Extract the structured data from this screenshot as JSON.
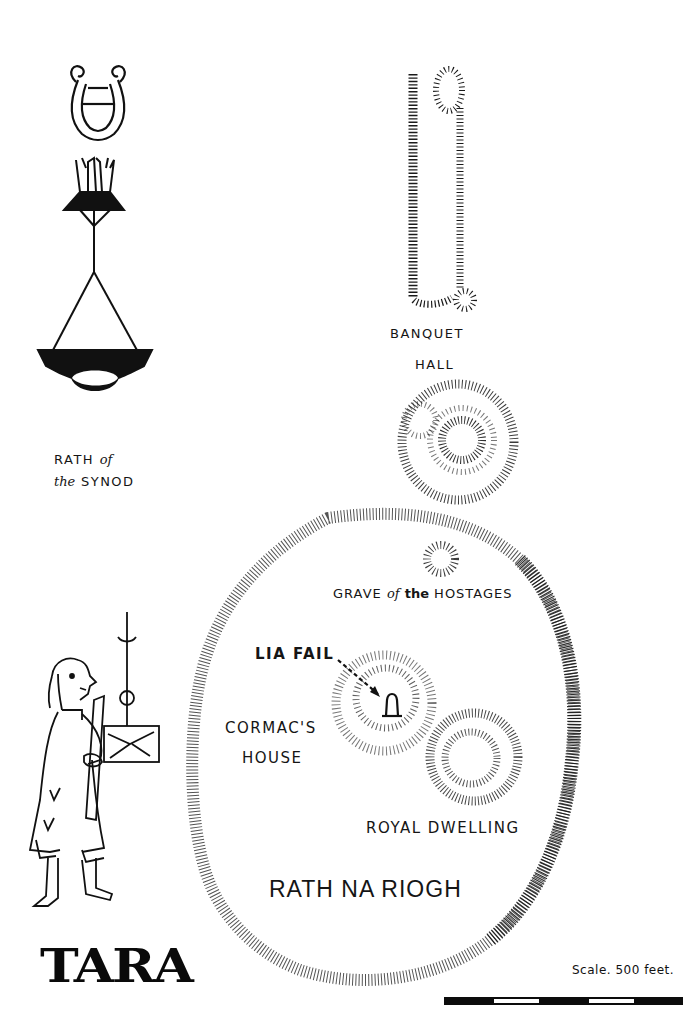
{
  "title": "TARA",
  "labels": {
    "banquet_hall_line1": "BANQUET",
    "banquet_hall_line2": "HALL",
    "rath_synod_line1_a": "RATH",
    "rath_synod_line1_b": "of",
    "rath_synod_line2_a": "the",
    "rath_synod_line2_b": "SYNOD",
    "grave_a": "GRAVE",
    "grave_b": "of",
    "grave_c": "the",
    "grave_d": "HOSTAGES",
    "lia_fail": "LIA FAIL",
    "cormacs_line1": "CORMAC'S",
    "cormacs_line2": "HOUSE",
    "royal_dwelling": "ROYAL DWELLING",
    "rath_na_riogh": "RATH NA RIOGH"
  },
  "scale": {
    "label": "Scale. 500 feet.",
    "segments": [
      "black",
      "white",
      "black",
      "white",
      "black"
    ]
  },
  "icons": {
    "lyre": "lyre-emblem",
    "lamp": "hanging-lamp-emblem",
    "figure": "scribe-figure-with-book",
    "stone": "lia-fail-standing-stone"
  },
  "colors": {
    "ink": "#111111",
    "paper": "#ffffff"
  }
}
